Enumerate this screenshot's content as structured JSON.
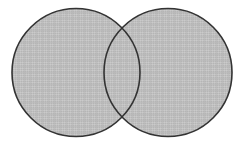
{
  "figure": {
    "name": "two-circle-venn-diagram",
    "canvas": {
      "width": 245,
      "height": 145,
      "background_color": "#ffffff"
    },
    "style": {
      "fill_color": "#b8b8b8",
      "fill_texture": "fine-crosshatch-grid",
      "texture_line_color": "#c9c9c9",
      "texture_pitch_px": 2,
      "stroke_color": "#333333",
      "stroke_width_px": 1.6,
      "overlap_fill_color": "#b8b8b8",
      "overlap_shaded_differently": "no"
    },
    "shapes": [
      {
        "id": "left-circle",
        "label": "",
        "center_x": 76,
        "center_y": 72.5,
        "radius": 64
      },
      {
        "id": "right-circle",
        "label": "",
        "center_x": 168,
        "center_y": 72.5,
        "radius": 64
      }
    ],
    "intersection_points": [
      {
        "id": "top-crossing",
        "x": 122,
        "y": 29
      },
      {
        "id": "bottom-crossing",
        "x": 122,
        "y": 118
      }
    ],
    "labels": {
      "left_region": "",
      "overlap_region": "",
      "right_region": "",
      "caption": ""
    }
  }
}
